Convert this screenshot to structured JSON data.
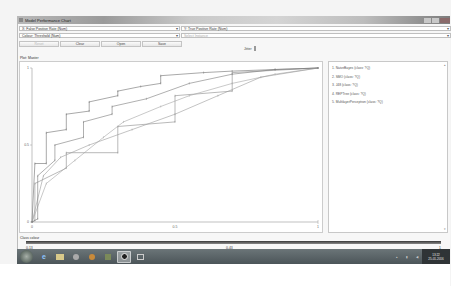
{
  "window": {
    "title": "Model Performance Chart"
  },
  "controls": {
    "x_axis": "X: False Positive Rate (Num)",
    "y_axis": "Y: True Positive Rate (Num)",
    "colour": "Colour: Threshold (Num)",
    "select_instance": "Select Instance",
    "buttons": {
      "reset": "Reset",
      "clear": "Clear",
      "open": "Open",
      "save": "Save"
    },
    "jitter_label": "Jitter"
  },
  "plot": {
    "label": "Plot: Master",
    "x_ticks": [
      "0",
      "0.5",
      "1"
    ],
    "y_ticks": [
      "0",
      "0.5",
      "1"
    ]
  },
  "legend": {
    "items": [
      "1. NaiveBayes (class: ?Q)",
      "2. SMO (class: ?Q)",
      "3. J48 (class: ?Q)",
      "4. REPTree (class: ?Q)",
      "5. MultilayerPerceptron (class: ?Q)"
    ]
  },
  "class_colour": {
    "label": "Class colour",
    "ticks": [
      "0.13",
      "0.43",
      "1"
    ]
  },
  "taskbar": {
    "icons": [
      "start-orb",
      "internet-explorer",
      "file-explorer",
      "media-player",
      "app-orange",
      "app-green",
      "weka",
      "app-window"
    ],
    "clock_time": "13:22",
    "clock_date": "25-01-2016"
  },
  "chart_data": {
    "type": "line",
    "xlabel": "False Positive Rate",
    "ylabel": "True Positive Rate",
    "xlim": [
      0,
      1
    ],
    "ylim": [
      0,
      1
    ],
    "x_ticks": [
      "0",
      "0.5",
      "1"
    ],
    "y_ticks": [
      "0",
      "0.5",
      "1"
    ],
    "grid": false,
    "legend_position": "right panel",
    "series": [
      {
        "name": "NaiveBayes",
        "x": [
          0,
          0.01,
          0.05,
          0.05,
          0.12,
          0.12,
          0.2,
          0.2,
          0.3,
          0.3,
          0.38,
          0.45,
          0.45,
          0.6,
          0.7,
          0.85,
          1.0
        ],
        "y": [
          0,
          0.38,
          0.38,
          0.58,
          0.6,
          0.7,
          0.72,
          0.78,
          0.82,
          0.85,
          0.88,
          0.9,
          0.95,
          0.97,
          0.98,
          0.99,
          1.0
        ]
      },
      {
        "name": "SMO",
        "x": [
          0,
          0.01,
          0.01,
          0.12,
          0.12,
          0.3,
          0.3,
          0.5,
          0.5,
          0.7,
          0.7,
          1.0
        ],
        "y": [
          0,
          0.01,
          0.25,
          0.35,
          0.45,
          0.45,
          0.62,
          0.65,
          0.82,
          0.85,
          0.97,
          1.0
        ]
      },
      {
        "name": "J48",
        "x": [
          0,
          0.05,
          0.15,
          0.25,
          0.32,
          0.45,
          0.55,
          0.7,
          0.85,
          1.0
        ],
        "y": [
          0,
          0.25,
          0.4,
          0.55,
          0.65,
          0.75,
          0.82,
          0.9,
          0.96,
          1.0
        ]
      },
      {
        "name": "REPTree",
        "x": [
          0,
          0.04,
          0.1,
          0.2,
          0.35,
          0.5,
          0.65,
          0.8,
          1.0
        ],
        "y": [
          0,
          0.3,
          0.42,
          0.5,
          0.6,
          0.7,
          0.82,
          0.94,
          1.0
        ]
      },
      {
        "name": "MultilayerPerceptron",
        "x": [
          0,
          0.02,
          0.02,
          0.08,
          0.08,
          0.18,
          0.18,
          0.28,
          0.28,
          0.4,
          0.55,
          0.7,
          0.85,
          1.0
        ],
        "y": [
          0,
          0.02,
          0.3,
          0.4,
          0.5,
          0.55,
          0.65,
          0.7,
          0.75,
          0.8,
          0.9,
          0.96,
          0.99,
          1.0
        ]
      }
    ]
  }
}
